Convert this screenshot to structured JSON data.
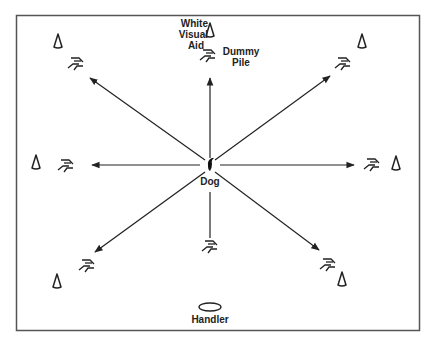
{
  "diagram": {
    "title": "",
    "labels": {
      "white_visual_aid": [
        "White",
        "Visual",
        "Aid"
      ],
      "dummy_pile": [
        "Dummy",
        "Pile"
      ],
      "dog": "Dog",
      "handler": "Handler"
    },
    "colors": {
      "background": "#ffffff",
      "frame": "#555555",
      "stroke": "#222222"
    },
    "nodes": [
      {
        "id": "dog",
        "label": "Dog",
        "x": 210,
        "y": 165
      },
      {
        "id": "handler",
        "label": "Handler",
        "x": 210,
        "y": 306
      }
    ],
    "piles": [
      {
        "id": "pile-n",
        "direction": "N",
        "x": 209,
        "y": 56,
        "has_visual_aid": true,
        "arrow": true
      },
      {
        "id": "pile-ne",
        "direction": "NE",
        "x": 344,
        "y": 64,
        "has_visual_aid": true,
        "arrow": true
      },
      {
        "id": "pile-e",
        "direction": "E",
        "x": 373,
        "y": 165,
        "has_visual_aid": true,
        "arrow": true
      },
      {
        "id": "pile-se",
        "direction": "SE",
        "x": 328,
        "y": 264,
        "has_visual_aid": true,
        "arrow": true
      },
      {
        "id": "pile-s",
        "direction": "S",
        "x": 210,
        "y": 246,
        "has_visual_aid": false,
        "arrow": false
      },
      {
        "id": "pile-sw",
        "direction": "SW",
        "x": 88,
        "y": 266,
        "has_visual_aid": true,
        "arrow": true
      },
      {
        "id": "pile-w",
        "direction": "W",
        "x": 66,
        "y": 166,
        "has_visual_aid": true,
        "arrow": true
      },
      {
        "id": "pile-nw",
        "direction": "NW",
        "x": 76,
        "y": 64,
        "has_visual_aid": true,
        "arrow": true
      }
    ]
  }
}
